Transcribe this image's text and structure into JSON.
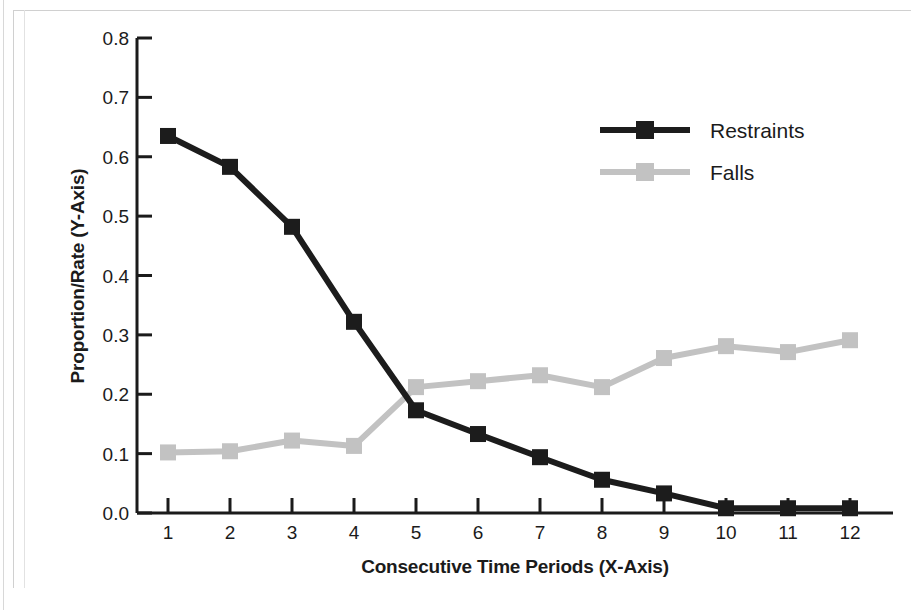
{
  "chart_data": {
    "type": "line",
    "title": "",
    "xlabel": "Consecutive Time Periods (X-Axis)",
    "ylabel": "Proportion/Rate (Y-Axis)",
    "x": [
      1,
      2,
      3,
      4,
      5,
      6,
      7,
      8,
      9,
      10,
      11,
      12
    ],
    "xticklabels": [
      "1",
      "2",
      "3",
      "4",
      "5",
      "6",
      "7",
      "8",
      "9",
      "10",
      "11",
      "12"
    ],
    "yticklabels": [
      "0.0",
      "0.1",
      "0.2",
      "0.3",
      "0.4",
      "0.5",
      "0.6",
      "0.7",
      "0.8"
    ],
    "ytickvalues": [
      0.0,
      0.1,
      0.2,
      0.3,
      0.4,
      0.5,
      0.6,
      0.7,
      0.8
    ],
    "xlim": [
      0.5,
      12.5
    ],
    "ylim": [
      0.0,
      0.8
    ],
    "grid": false,
    "legend_position": "upper right",
    "marker": "square",
    "series": [
      {
        "name": "Restraints",
        "color": "#1c1c1c",
        "values": [
          0.635,
          0.583,
          0.482,
          0.322,
          0.173,
          0.133,
          0.094,
          0.056,
          0.033,
          0.008,
          0.008,
          0.008
        ]
      },
      {
        "name": "Falls",
        "color": "#c2c2c2",
        "values": [
          0.102,
          0.104,
          0.122,
          0.113,
          0.212,
          0.222,
          0.232,
          0.212,
          0.261,
          0.281,
          0.271,
          0.291
        ]
      }
    ]
  },
  "legend": {
    "entries": [
      {
        "label": "Restraints",
        "color": "#1c1c1c"
      },
      {
        "label": "Falls",
        "color": "#c2c2c2"
      }
    ]
  },
  "axes": {
    "x_title": "Consecutive Time Periods (X-Axis)",
    "y_title": "Proportion/Rate (Y-Axis)"
  },
  "caption": ""
}
